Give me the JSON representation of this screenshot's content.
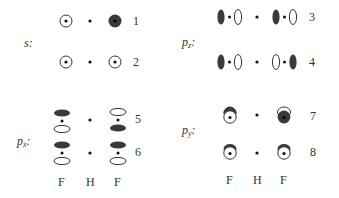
{
  "diagram": {
    "colors": {
      "filled_lobe": "#3a3a3a",
      "open_lobe_stroke": "#333333",
      "background": "#ffffff"
    },
    "sections": [
      {
        "id": "s",
        "label_main": "s",
        "label_sub": "",
        "label_suffix": ":",
        "rows": [
          {
            "number": "1",
            "left_F": "s-orbital open (+)",
            "H": "atom dot",
            "right_F": "s-orbital filled (-)"
          },
          {
            "number": "2",
            "left_F": "s-orbital open (+)",
            "H": "atom dot",
            "right_F": "s-orbital open (+)"
          }
        ]
      },
      {
        "id": "pz",
        "label_main": "p",
        "label_sub": "z",
        "label_suffix": ":",
        "rows": [
          {
            "number": "3",
            "left_F": "pz filled-left / open-right",
            "H": "atom dot",
            "right_F": "pz filled-left / open-right"
          },
          {
            "number": "4",
            "left_F": "pz filled-left / open-right",
            "H": "atom dot",
            "right_F": "pz open-left / filled-right"
          }
        ]
      },
      {
        "id": "px",
        "label_main": "p",
        "label_sub": "x",
        "label_suffix": ":",
        "rows": [
          {
            "number": "5",
            "left_F": "px filled-top / open-bottom",
            "H": "atom dot",
            "right_F": "px open-top / filled-bottom"
          },
          {
            "number": "6",
            "left_F": "px filled-top / open-bottom",
            "H": "atom dot",
            "right_F": "px filled-top / open-bottom"
          }
        ]
      },
      {
        "id": "py",
        "label_main": "p",
        "label_sub": "y",
        "label_suffix": ":",
        "rows": [
          {
            "number": "7",
            "left_F": "py open front / filled back",
            "H": "atom dot",
            "right_F": "py filled front / open back"
          },
          {
            "number": "8",
            "left_F": "py open front / filled back",
            "H": "atom dot",
            "right_F": "py open front / filled back"
          }
        ]
      }
    ],
    "atom_labels_left": [
      "F",
      "H",
      "F"
    ],
    "atom_labels_right": [
      "F",
      "H",
      "F"
    ]
  }
}
